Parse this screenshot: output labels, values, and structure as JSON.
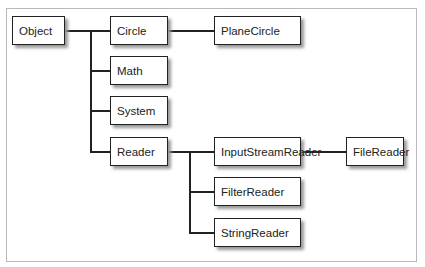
{
  "diagram": {
    "type": "class-hierarchy",
    "nodes": {
      "object": "Object",
      "circle": "Circle",
      "plane_circle": "PlaneCircle",
      "math": "Math",
      "system": "System",
      "reader": "Reader",
      "input_stream_reader": "InputStreamReader",
      "file_reader": "FileReader",
      "filter_reader": "FilterReader",
      "string_reader": "StringReader"
    },
    "edges": [
      [
        "Object",
        "Circle"
      ],
      [
        "Object",
        "Math"
      ],
      [
        "Object",
        "System"
      ],
      [
        "Object",
        "Reader"
      ],
      [
        "Circle",
        "PlaneCircle"
      ],
      [
        "Reader",
        "InputStreamReader"
      ],
      [
        "Reader",
        "FilterReader"
      ],
      [
        "Reader",
        "StringReader"
      ],
      [
        "InputStreamReader",
        "FileReader"
      ]
    ]
  }
}
